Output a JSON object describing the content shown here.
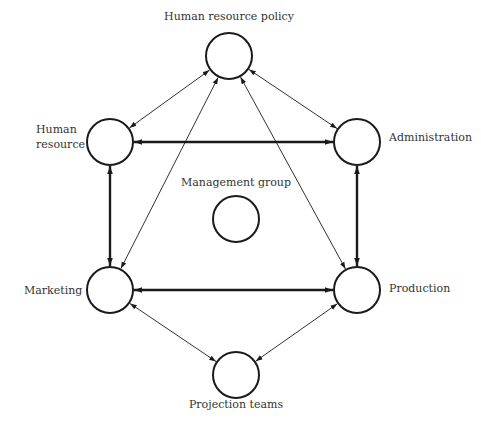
{
  "diagram": {
    "width": 481,
    "height": 427,
    "colors": {
      "stroke": "#1a1a1a",
      "text": "#333333",
      "background": "#ffffff"
    },
    "nodes": [
      {
        "id": "hr-policy",
        "cx": 229,
        "cy": 56,
        "r": 23,
        "label_lines": [
          "Human resource policy"
        ],
        "label_x": 229,
        "label_y": 20,
        "anchor": "middle"
      },
      {
        "id": "human-resource",
        "cx": 110,
        "cy": 142,
        "r": 23,
        "label_lines": [
          "Human",
          "resource"
        ],
        "label_x": 36,
        "label_y": 133,
        "anchor": "start"
      },
      {
        "id": "administration",
        "cx": 357,
        "cy": 142,
        "r": 23,
        "label_lines": [
          "Administration"
        ],
        "label_x": 389,
        "label_y": 141,
        "anchor": "start"
      },
      {
        "id": "management-group",
        "cx": 236,
        "cy": 219,
        "r": 23,
        "label_lines": [
          "Management group"
        ],
        "label_x": 236,
        "label_y": 186,
        "anchor": "middle"
      },
      {
        "id": "marketing",
        "cx": 110,
        "cy": 290,
        "r": 23,
        "label_lines": [
          "Marketing"
        ],
        "label_x": 24,
        "label_y": 294,
        "anchor": "start"
      },
      {
        "id": "production",
        "cx": 357,
        "cy": 290,
        "r": 23,
        "label_lines": [
          "Production"
        ],
        "label_x": 389,
        "label_y": 292,
        "anchor": "start"
      },
      {
        "id": "projection-teams",
        "cx": 236,
        "cy": 375,
        "r": 23,
        "label_lines": [
          "Projection teams"
        ],
        "label_x": 236,
        "label_y": 408,
        "anchor": "middle"
      }
    ],
    "edges": [
      {
        "from": "hr-policy",
        "to": "human-resource",
        "weight": "thin"
      },
      {
        "from": "hr-policy",
        "to": "administration",
        "weight": "thin"
      },
      {
        "from": "hr-policy",
        "to": "marketing",
        "weight": "thin"
      },
      {
        "from": "hr-policy",
        "to": "production",
        "weight": "thin"
      },
      {
        "from": "human-resource",
        "to": "administration",
        "weight": "thick"
      },
      {
        "from": "human-resource",
        "to": "marketing",
        "weight": "thick"
      },
      {
        "from": "administration",
        "to": "production",
        "weight": "thick"
      },
      {
        "from": "marketing",
        "to": "production",
        "weight": "thick"
      },
      {
        "from": "marketing",
        "to": "projection-teams",
        "weight": "thin"
      },
      {
        "from": "production",
        "to": "projection-teams",
        "weight": "thin"
      }
    ]
  }
}
